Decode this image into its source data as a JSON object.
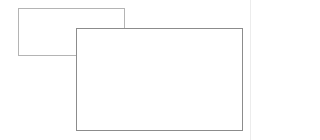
{
  "shapes": {
    "back_window": {
      "border_color": "#b4b4b4",
      "fill": "#ffffff"
    },
    "front_window": {
      "border_color": "#8c8c8c",
      "fill": "#ffffff"
    },
    "right_edge": {
      "color": "#ececec"
    }
  }
}
